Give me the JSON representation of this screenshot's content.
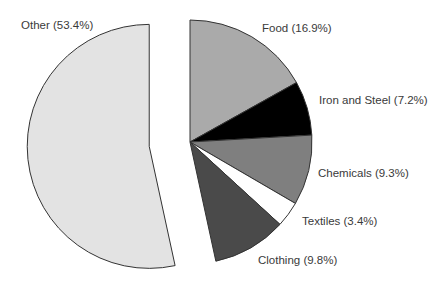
{
  "chart_data": {
    "type": "pie",
    "title": "",
    "start_angle_deg": 0,
    "direction": "clockwise",
    "exploded": [
      "Other"
    ],
    "slices": [
      {
        "label": "Food",
        "value": 16.9,
        "display": "Food (16.9%)",
        "color": "#aaaaaa"
      },
      {
        "label": "Iron and Steel",
        "value": 7.2,
        "display": "Iron and Steel (7.2%)",
        "color": "#000000"
      },
      {
        "label": "Chemicals",
        "value": 9.3,
        "display": "Chemicals (9.3%)",
        "color": "#7f7f7f"
      },
      {
        "label": "Textiles",
        "value": 3.4,
        "display": "Textiles (3.4%)",
        "color": "#ffffff"
      },
      {
        "label": "Clothing",
        "value": 9.8,
        "display": "Clothing (9.8%)",
        "color": "#4a4a4a"
      },
      {
        "label": "Other",
        "value": 53.4,
        "display": "Other (53.4%)",
        "color": "#e3e3e3"
      }
    ]
  },
  "layout": {
    "center": [
      190,
      142
    ],
    "radius": 122,
    "explode_offset": 41,
    "label_positions": {
      "Food": [
        262,
        32
      ],
      "Iron and Steel": [
        319,
        104
      ],
      "Chemicals": [
        318,
        177
      ],
      "Textiles": [
        302,
        225
      ],
      "Clothing": [
        258,
        264
      ],
      "Other": [
        21,
        29
      ]
    }
  }
}
